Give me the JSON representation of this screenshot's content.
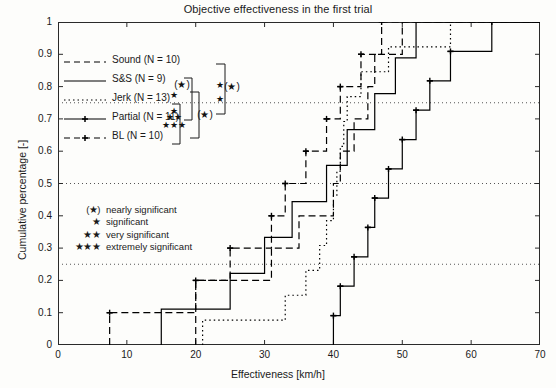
{
  "chart_data": {
    "type": "line",
    "title": "Objective effectiveness in the first trial",
    "xlabel": "Effectiveness [km/h]",
    "ylabel": "Cumulative percentage [-]",
    "xlim": [
      0,
      70
    ],
    "ylim": [
      0,
      1
    ],
    "xticks": [
      0,
      10,
      20,
      30,
      40,
      50,
      60,
      70
    ],
    "yticks": [
      0,
      0.1,
      0.2,
      0.3,
      0.4,
      0.5,
      0.6,
      0.7,
      0.8,
      0.9,
      1
    ],
    "grid": "horizontal dotted gridlines at 0.25, 0.5, 0.75",
    "legend_position": "upper left",
    "step_type": "post",
    "series": [
      {
        "name": "Sound  (N = 10)",
        "label": "Sound",
        "n": 10,
        "linestyle": "dashed",
        "marker": "none",
        "color": "#000000",
        "x": [
          20,
          20,
          31,
          35,
          40,
          41,
          43,
          45,
          46,
          50
        ],
        "y": [
          0.1,
          0.2,
          0.3,
          0.4,
          0.5,
          0.6,
          0.7,
          0.8,
          0.9,
          1.0
        ]
      },
      {
        "name": "S&S  (N = 9)",
        "label": "S&S",
        "n": 9,
        "linestyle": "solid",
        "marker": "none",
        "color": "#000000",
        "x": [
          15,
          25,
          30,
          34,
          39,
          42,
          46,
          49,
          52
        ],
        "y": [
          0.111,
          0.222,
          0.333,
          0.444,
          0.556,
          0.667,
          0.778,
          0.889,
          1.0
        ]
      },
      {
        "name": "Jerk  (N = 13)",
        "label": "Jerk",
        "n": 13,
        "linestyle": "dotted",
        "marker": "none",
        "color": "#000000",
        "x": [
          21,
          33,
          36,
          38,
          39,
          40,
          40.5,
          41,
          41.5,
          42,
          44,
          48,
          57
        ],
        "y": [
          0.077,
          0.154,
          0.231,
          0.308,
          0.385,
          0.462,
          0.538,
          0.615,
          0.692,
          0.769,
          0.846,
          0.923,
          1.0
        ]
      },
      {
        "name": "Partial  (N = 11)",
        "label": "Partial",
        "n": 11,
        "linestyle": "solid",
        "marker": "plus",
        "color": "#000000",
        "x": [
          40,
          41,
          43,
          45,
          46,
          48,
          50,
          52,
          54,
          57,
          63
        ],
        "y": [
          0.091,
          0.182,
          0.273,
          0.364,
          0.455,
          0.545,
          0.636,
          0.727,
          0.818,
          0.909,
          1.0
        ]
      },
      {
        "name": "BL  (N = 10)",
        "label": "BL",
        "n": 10,
        "linestyle": "dashed",
        "marker": "plus",
        "color": "#000000",
        "x": [
          7.5,
          20,
          25,
          31,
          33,
          36,
          39,
          41,
          44,
          47
        ],
        "y": [
          0.1,
          0.2,
          0.3,
          0.4,
          0.5,
          0.6,
          0.7,
          0.8,
          0.9,
          1.0
        ]
      }
    ],
    "annotations": {
      "significance_key": [
        {
          "symbol": "(★)",
          "text": "nearly significant"
        },
        {
          "symbol": "★",
          "text": "significant"
        },
        {
          "symbol": "★★",
          "text": "very significant"
        },
        {
          "symbol": "★★★",
          "text": "extremely significant"
        }
      ],
      "brackets": [
        {
          "symbol": "(★)",
          "level": 1
        },
        {
          "symbol": "(★)",
          "level": 2
        },
        {
          "symbol": "(★)",
          "level": 3
        },
        {
          "symbol": "★",
          "level": 0
        },
        {
          "symbol": "★★",
          "level": 0
        },
        {
          "symbol": "★★★",
          "level": 0
        }
      ]
    }
  },
  "legend": {
    "items": [
      {
        "label": "Sound  (N = 10)",
        "style": "dashed"
      },
      {
        "label": "S&S  (N = 9)",
        "style": "solid"
      },
      {
        "label": "Jerk  (N = 13)",
        "style": "dotted"
      },
      {
        "label": "Partial  (N = 11)",
        "style": "solid-marker"
      },
      {
        "label": "BL  (N = 10)",
        "style": "dashed-marker"
      }
    ]
  },
  "axes": {
    "title": "Objective effectiveness in the first trial",
    "xlabel": "Effectiveness [km/h]",
    "ylabel": "Cumulative percentage [-]",
    "xticklabels": [
      "0",
      "10",
      "20",
      "30",
      "40",
      "50",
      "60",
      "70"
    ],
    "yticklabels": [
      "0",
      "0.1",
      "0.2",
      "0.3",
      "0.4",
      "0.5",
      "0.6",
      "0.7",
      "0.8",
      "0.9",
      "1"
    ]
  }
}
